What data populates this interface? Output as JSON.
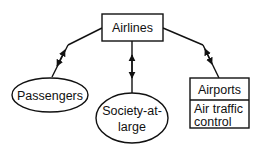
{
  "diagram": {
    "nodes": {
      "airlines": {
        "label": "Airlines",
        "shape": "rectangle"
      },
      "passengers": {
        "label": "Passengers",
        "shape": "ellipse"
      },
      "society": {
        "label_line1": "Society-at-",
        "label_line2": "large",
        "shape": "ellipse"
      },
      "airports": {
        "label": "Airports",
        "sublabel_line1": "Air traffic",
        "sublabel_line2": "control",
        "shape": "split-rectangle"
      }
    },
    "edges": [
      {
        "from": "airlines",
        "to": "passengers",
        "type": "bidirectional-arrow"
      },
      {
        "from": "airlines",
        "to": "society",
        "type": "bidirectional-arrow"
      },
      {
        "from": "airlines",
        "to": "airports",
        "type": "bidirectional-arrow"
      }
    ],
    "colors": {
      "stroke": "#111111",
      "background": "#ffffff"
    }
  }
}
